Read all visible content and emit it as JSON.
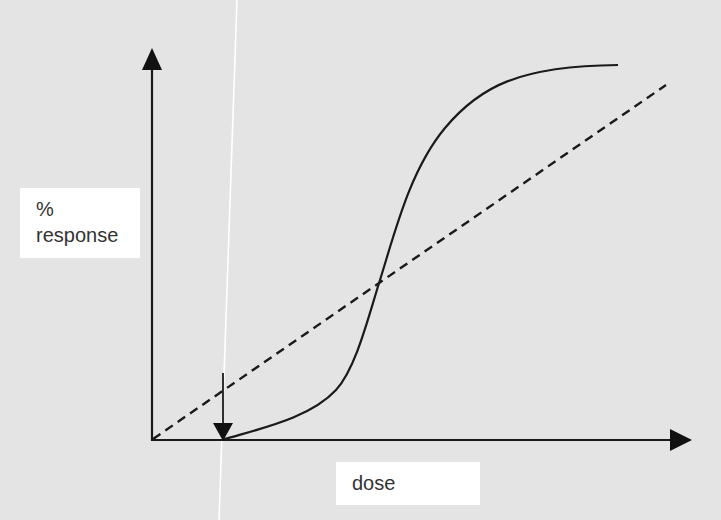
{
  "diagram": {
    "type": "dose-response",
    "y_axis": {
      "label_line1": "%",
      "label_line2": "response"
    },
    "x_axis": {
      "label": "dose"
    },
    "curves": [
      {
        "name": "sigmoid-dose-response",
        "style": "solid",
        "description": "S-shaped curve starting at threshold dose, rising steeply, plateauing near maximum"
      },
      {
        "name": "linear-dose-response",
        "style": "dashed",
        "description": "Straight line from origin rising proportionally with dose"
      }
    ],
    "annotations": [
      {
        "name": "threshold-arrow",
        "description": "Downward arrow marking threshold dose where sigmoid curve begins"
      }
    ],
    "colors": {
      "background": "#e4e4e4",
      "ink": "#1a1a1a",
      "label_box": "#ffffff",
      "label_text": "#333333",
      "scan_artifact": "#ffffff"
    }
  }
}
